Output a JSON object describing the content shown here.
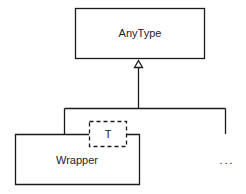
{
  "diagram": {
    "type": "uml-class-inheritance",
    "colors": {
      "stroke": "#1a1a1a",
      "text": "#222222",
      "background": "#ffffff"
    },
    "classes": [
      {
        "id": "anytype",
        "label": "AnyType"
      },
      {
        "id": "wrapper",
        "label": "Wrapper",
        "template_parameter": "T"
      }
    ],
    "ellipsis": "...",
    "relations": [
      {
        "type": "generalization",
        "from": "wrapper",
        "to": "anytype"
      },
      {
        "type": "generalization",
        "from": "ellipsis",
        "to": "anytype"
      }
    ]
  }
}
